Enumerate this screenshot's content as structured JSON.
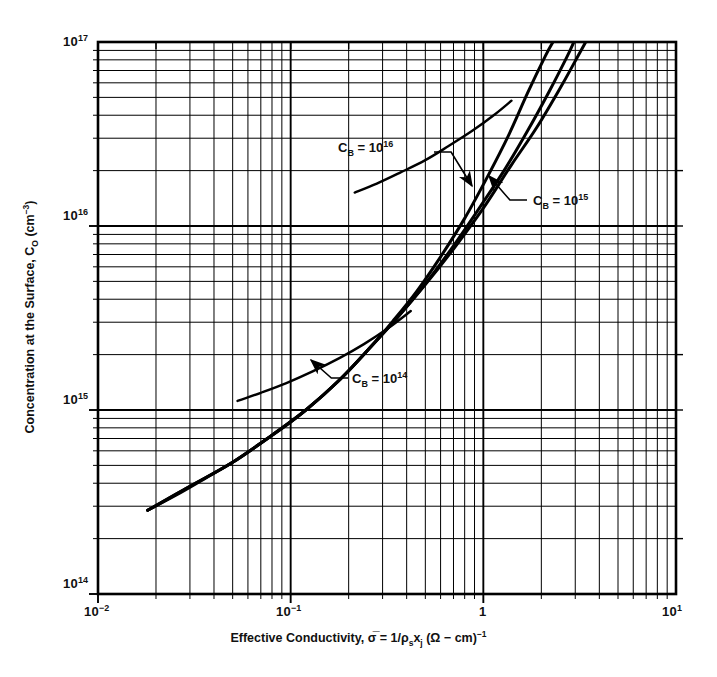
{
  "figure": {
    "background_color": "#ffffff",
    "line_color": "#000000"
  },
  "chart_data": {
    "type": "line",
    "title": "",
    "subtitle": "",
    "xlabel_parts": {
      "text_lead": "Effective Conductivity, ",
      "sigma_bar": "σ̅",
      "equals": " = 1/",
      "rho": "ρ",
      "rho_sub": "s",
      "x_sym": "x",
      "x_sub": "j",
      "units_open": " (Ω − cm)",
      "units_exp": "−1"
    },
    "xlabel": "Effective Conductivity, σ̅ = 1/ρs xj (Ω − cm)−1",
    "ylabel_parts": {
      "text_lead": "Concentration at the Surface, C",
      "c_sub": "O",
      "units_open": " (cm",
      "units_exp": "−3",
      "units_close": ")"
    },
    "ylabel": "Concentration at the Surface, CO (cm−3)",
    "xscale": "log",
    "yscale": "log",
    "xlim": [
      0.01,
      10
    ],
    "ylim": [
      100000000000000.0,
      1e+17
    ],
    "grid": "log-minor-major",
    "legend_position": "inline-annotations",
    "xticks": [
      {
        "value": 0.01,
        "label_mantissa": "10",
        "label_exp": "−2"
      },
      {
        "value": 0.1,
        "label_mantissa": "10",
        "label_exp": "−1"
      },
      {
        "value": 1,
        "label_mantissa": "1",
        "label_exp": ""
      },
      {
        "value": 10,
        "label_mantissa": "10",
        "label_exp": "1"
      }
    ],
    "yticks": [
      {
        "value": 100000000000000.0,
        "label_mantissa": "10",
        "label_exp": "14"
      },
      {
        "value": 1000000000000000.0,
        "label_mantissa": "10",
        "label_exp": "15"
      },
      {
        "value": 1e+16,
        "label_mantissa": "10",
        "label_exp": "16"
      },
      {
        "value": 1e+17,
        "label_mantissa": "10",
        "label_exp": "17"
      }
    ],
    "series": [
      {
        "name": "C_B = 10^14",
        "label_text_lead": "C",
        "label_sub": "B",
        "label_mid": " = 10",
        "label_sup": "14",
        "points": [
          [
            0.0181,
            285000000000000.0
          ],
          [
            0.0255,
            345000000000000.0
          ],
          [
            0.036,
            425000000000000.0
          ],
          [
            0.05,
            520000000000000.0
          ],
          [
            0.07,
            660000000000000.0
          ],
          [
            0.1,
            860000000000000.0
          ],
          [
            0.14,
            1150000000000000.0
          ],
          [
            0.19,
            1550000000000000.0
          ],
          [
            0.255,
            2150000000000000.0
          ],
          [
            0.36,
            3200000000000000.0
          ],
          [
            0.5,
            4800000000000000.0
          ],
          [
            0.7,
            7500000000000000.0
          ],
          [
            1.0,
            1.25e+16
          ],
          [
            1.4,
            2.15e+16
          ],
          [
            1.9,
            3.45e+16
          ],
          [
            2.55,
            5.8e+16
          ],
          [
            3.1,
            8.4e+16
          ],
          [
            3.4,
            1e+17
          ]
        ]
      },
      {
        "name": "C_B = 10^15",
        "label_text_lead": "C",
        "label_sub": "B",
        "label_mid": " = 10",
        "label_sup": "15",
        "points": [
          [
            0.0181,
            285000000000000.0
          ],
          [
            0.03,
            385000000000000.0
          ],
          [
            0.05,
            520000000000000.0
          ],
          [
            0.08,
            730000000000000.0
          ],
          [
            0.12,
            1000000000000000.0
          ],
          [
            0.18,
            1460000000000000.0
          ],
          [
            0.255,
            2150000000000000.0
          ],
          [
            0.36,
            3200000000000000.0
          ],
          [
            0.5,
            4850000000000000.0
          ],
          [
            0.7,
            7800000000000000.0
          ],
          [
            1.0,
            1.35e+16
          ],
          [
            1.3,
            2.05e+16
          ],
          [
            1.7,
            3.3e+16
          ],
          [
            2.2,
            5.4e+16
          ],
          [
            2.7,
            8.2e+16
          ],
          [
            2.95,
            1e+17
          ]
        ]
      },
      {
        "name": "C_B = 10^16",
        "label_text_lead": "C",
        "label_sub": "B",
        "label_mid": " = 10",
        "label_sup": "16",
        "points": [
          [
            0.0181,
            285000000000000.0
          ],
          [
            0.03,
            385000000000000.0
          ],
          [
            0.05,
            520000000000000.0
          ],
          [
            0.08,
            730000000000000.0
          ],
          [
            0.12,
            1000000000000000.0
          ],
          [
            0.18,
            1460000000000000.0
          ],
          [
            0.255,
            2150000000000000.0
          ],
          [
            0.34,
            3050000000000000.0
          ],
          [
            0.45,
            4400000000000000.0
          ],
          [
            0.6,
            6800000000000000.0
          ],
          [
            0.8,
            1.1e+16
          ],
          [
            1.05,
            1.85e+16
          ],
          [
            1.35,
            3.1e+16
          ],
          [
            1.7,
            5.3e+16
          ],
          [
            2.1,
            8.4e+16
          ],
          [
            2.3,
            1e+17
          ]
        ]
      },
      {
        "name": "C_B = 10^14 upper branch",
        "points": [
          [
            0.053,
            1120000000000000.0
          ],
          [
            0.07,
            1240000000000000.0
          ],
          [
            0.095,
            1400000000000000.0
          ],
          [
            0.13,
            1620000000000000.0
          ],
          [
            0.18,
            1920000000000000.0
          ],
          [
            0.24,
            2280000000000000.0
          ],
          [
            0.32,
            2780000000000000.0
          ],
          [
            0.42,
            3450000000000000.0
          ]
        ]
      },
      {
        "name": "C_B = 10^15 upper branch",
        "points": [
          [
            0.215,
            1.52e+16
          ],
          [
            0.28,
            1.7e+16
          ],
          [
            0.37,
            1.95e+16
          ],
          [
            0.5,
            2.28e+16
          ],
          [
            0.66,
            2.72e+16
          ],
          [
            0.88,
            3.3e+16
          ],
          [
            1.15,
            4.05e+16
          ],
          [
            1.4,
            4.8e+16
          ]
        ]
      }
    ],
    "annotations": [
      {
        "id": "cb16-annotation",
        "text": "C_B = 10^16",
        "text_lead": "C",
        "sub": "B",
        "mid": " = 10",
        "sup": "16",
        "label_x_px": 338,
        "label_y_px": 140,
        "leader_from_px": [
          434,
          152
        ],
        "leader_to_px": [
          472,
          186
        ]
      },
      {
        "id": "cb15-annotation",
        "text": "C_B = 10^15",
        "text_lead": "C",
        "sub": "B",
        "mid": " = 10",
        "sup": "15",
        "label_x_px": 533,
        "label_y_px": 193,
        "leader_from_px": [
          527,
          200
        ],
        "leader_to_px": [
          489,
          176
        ]
      },
      {
        "id": "cb14-annotation",
        "text": "C_B = 10^14",
        "text_lead": "C",
        "sub": "B",
        "mid": " = 10",
        "sup": "14",
        "label_x_px": 352,
        "label_y_px": 371,
        "leader_from_px": [
          348,
          378
        ],
        "leader_to_px": [
          311,
          360
        ]
      }
    ]
  }
}
